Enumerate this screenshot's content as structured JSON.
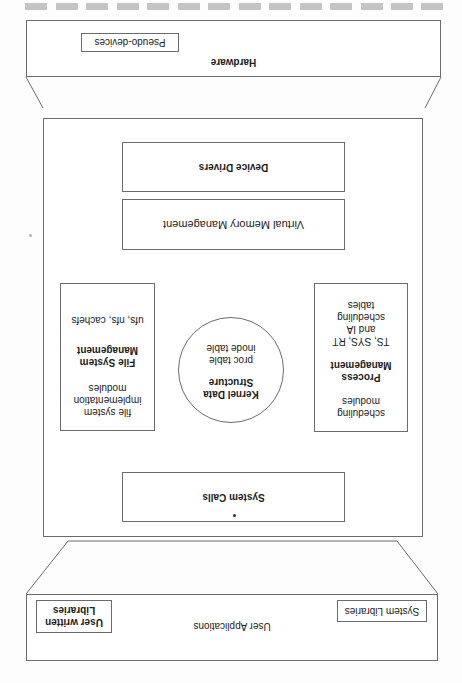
{
  "diagram": {
    "orientation": "rotated 180 degrees",
    "hardware": {
      "label": "Hardware",
      "pseudo_devices_label": "Pseudo-devices"
    },
    "kernel": {
      "device_drivers_label": "Device Drivers",
      "virtual_memory_label": "Virtual Memory Management",
      "file_system": {
        "top_text": [
          "file system",
          "implementation",
          "modules"
        ],
        "title": [
          "File System",
          "Management"
        ],
        "bottom_text": "ufs, nfs, cachefs"
      },
      "kernel_data": {
        "title": [
          "Kernel Data",
          "Structure"
        ],
        "items": [
          "proc table",
          "inode table"
        ]
      },
      "process": {
        "top_text": [
          "scheduling",
          "modules"
        ],
        "title": [
          "Process",
          "Management"
        ],
        "bottom_text": [
          "TS, SYS, RT",
          "and IA",
          "scheduling",
          "tables"
        ]
      },
      "system_calls_label": "System Calls"
    },
    "user": {
      "label": "User Applications",
      "system_libraries_label": "System Libraries",
      "user_libraries_label": [
        "User written",
        "Libraries"
      ]
    },
    "colors": {
      "line": "#6b6b6b",
      "dash": "#c4c4c4",
      "text": "#1c1c1c"
    }
  }
}
